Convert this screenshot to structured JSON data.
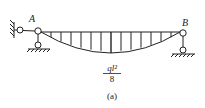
{
  "diagram": {
    "type": "bending-moment-diagram",
    "labels": {
      "left_node": "A",
      "right_node": "B",
      "moment_numerator": "ql²",
      "moment_denominator": "8",
      "caption": "(a)"
    },
    "colors": {
      "stroke": "#222222",
      "background": "#ffffff"
    }
  }
}
